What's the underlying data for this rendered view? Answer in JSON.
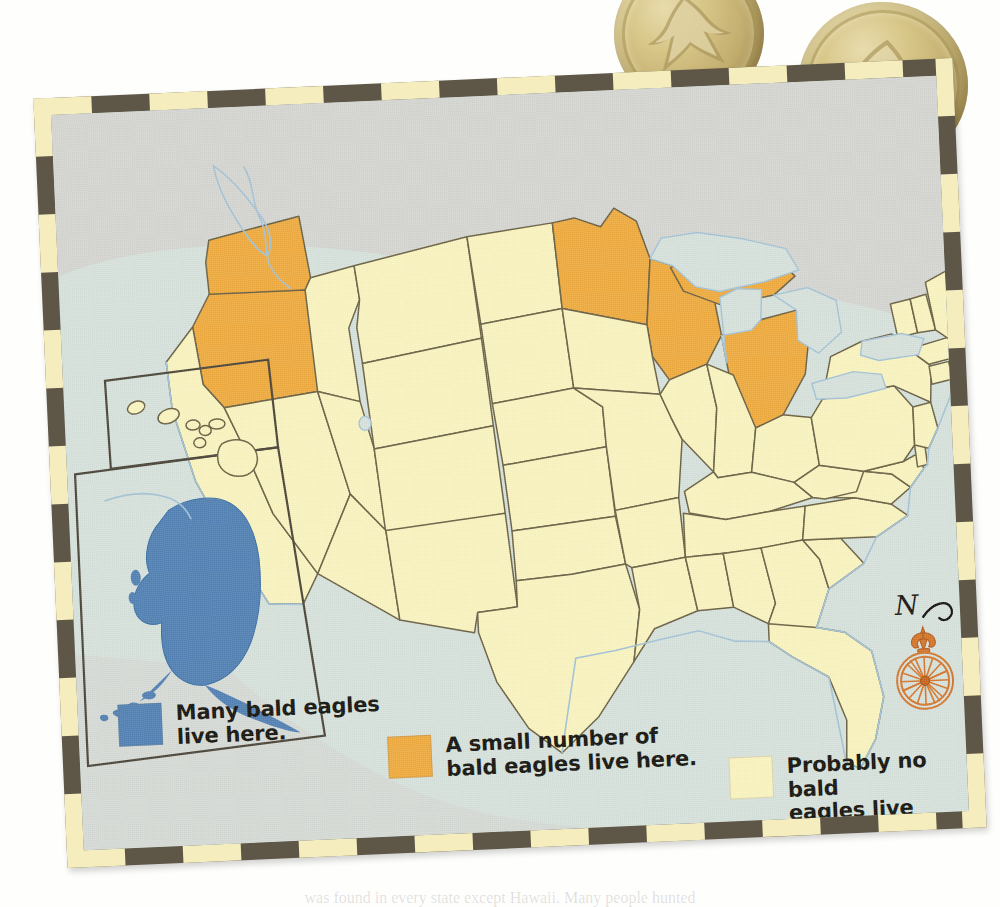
{
  "page": {
    "background_color": "#ffffff",
    "bottom_caption": "was found in every state except Hawaii. Many people hunted"
  },
  "objects": {
    "coins": [
      {
        "name": "gold-eagle-coin-left",
        "motif": "eagle",
        "color": "#c9b478"
      },
      {
        "name": "gold-eagle-coin-right",
        "motif": "eagle",
        "color": "#c9b478"
      }
    ]
  },
  "map": {
    "title": "Bald eagles in the United States",
    "frame": {
      "dark_color": "#5e5747",
      "light_color": "#f6edbe"
    },
    "background_color": "#d7e2dc",
    "water_color": "#d7e2dc",
    "outline_color": "#6b6245",
    "coast_color": "#a9c7d8",
    "colors": {
      "many": "#5382b4",
      "small": "#efab40",
      "none": "#faf4c0"
    },
    "insets": [
      {
        "name": "hawaii-inset",
        "label": "Hawaii"
      },
      {
        "name": "alaska-inset",
        "label": "Alaska"
      }
    ],
    "state_categories": {
      "many": [
        "Alaska"
      ],
      "small": [
        "Washington",
        "Oregon",
        "Minnesota",
        "Wisconsin",
        "Michigan"
      ],
      "none": [
        "California",
        "Nevada",
        "Idaho",
        "Montana",
        "Wyoming",
        "Utah",
        "Arizona",
        "Colorado",
        "New Mexico",
        "North Dakota",
        "South Dakota",
        "Nebraska",
        "Kansas",
        "Oklahoma",
        "Texas",
        "Iowa",
        "Missouri",
        "Arkansas",
        "Louisiana",
        "Illinois",
        "Indiana",
        "Ohio",
        "Kentucky",
        "Tennessee",
        "Mississippi",
        "Alabama",
        "Georgia",
        "Florida",
        "South Carolina",
        "North Carolina",
        "Virginia",
        "West Virginia",
        "Maryland",
        "Delaware",
        "Pennsylvania",
        "New Jersey",
        "New York",
        "Connecticut",
        "Rhode Island",
        "Massachusetts",
        "Vermont",
        "New Hampshire",
        "Maine",
        "Hawaii"
      ]
    },
    "compass": {
      "north_label": "N",
      "color": "#d4772e"
    }
  },
  "legend": {
    "items": [
      {
        "key": "many",
        "swatch_color": "#5382b4",
        "label": "Many bald eagles\nlive here."
      },
      {
        "key": "small",
        "swatch_color": "#efab40",
        "label": "A small number of\nbald eagles live here."
      },
      {
        "key": "none",
        "swatch_color": "#faf4c0",
        "label": "Probably no bald\neagles live here."
      }
    ]
  }
}
